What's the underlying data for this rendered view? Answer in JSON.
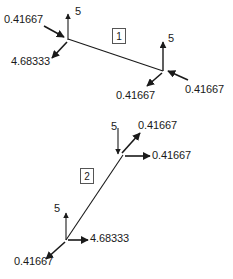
{
  "figure": {
    "type": "force-diagram",
    "background_color": "#ffffff",
    "line_color": "#1a1a1a",
    "text_color": "#1a1a1a",
    "width": 233,
    "height": 279
  },
  "elements": [
    {
      "id": "element-1",
      "number_label": "1",
      "box": {
        "x": 112,
        "y": 28
      },
      "member": {
        "x1": 68,
        "y1": 39,
        "x2": 163,
        "y2": 71
      },
      "nodes": [
        {
          "id": "element-1-node-left",
          "x": 68,
          "y": 39,
          "forces": [
            {
              "id": "e1-n1-vertical",
              "value": "5",
              "direction": "up",
              "label_x": 75,
              "label_y": 6
            },
            {
              "id": "e1-n1-axial",
              "value": "0.41667",
              "direction": "right-down-into-node",
              "label_x": 4,
              "label_y": 14
            },
            {
              "id": "e1-n1-shear",
              "value": "4.68333",
              "direction": "down-left-out-of-node",
              "label_x": 11,
              "label_y": 56
            }
          ]
        },
        {
          "id": "element-1-node-right",
          "x": 163,
          "y": 71,
          "forces": [
            {
              "id": "e1-n2-vertical",
              "value": "5",
              "direction": "up",
              "label_x": 168,
              "label_y": 33
            },
            {
              "id": "e1-n2-axial",
              "value": "0.41667",
              "direction": "left-into-node",
              "label_x": 185,
              "label_y": 84
            },
            {
              "id": "e1-n2-shear",
              "value": "0.41667",
              "direction": "down-left-out-of-node",
              "label_x": 116,
              "label_y": 90
            }
          ]
        }
      ]
    },
    {
      "id": "element-2",
      "number_label": "2",
      "box": {
        "x": 80,
        "y": 168
      },
      "member": {
        "x1": 123,
        "y1": 155,
        "x2": 66,
        "y2": 240
      },
      "nodes": [
        {
          "id": "element-2-node-top",
          "x": 123,
          "y": 155,
          "forces": [
            {
              "id": "e2-n1-vertical",
              "value": "5",
              "direction": "down-into-node",
              "label_x": 111,
              "label_y": 121
            },
            {
              "id": "e2-n1-diagonal",
              "value": "0.41667",
              "direction": "up-right-out-of-node",
              "label_x": 138,
              "label_y": 120
            },
            {
              "id": "e2-n1-horizontal",
              "value": "0.41667",
              "direction": "right-out-of-node",
              "label_x": 152,
              "label_y": 151
            }
          ]
        },
        {
          "id": "element-2-node-bottom",
          "x": 66,
          "y": 240,
          "forces": [
            {
              "id": "e2-n2-vertical",
              "value": "5",
              "direction": "up",
              "label_x": 54,
              "label_y": 203
            },
            {
              "id": "e2-n2-horizontal",
              "value": "4.68333",
              "direction": "right-out-of-node",
              "label_x": 88,
              "label_y": 232
            },
            {
              "id": "e2-n2-diagonal",
              "value": "0.41667",
              "direction": "down-left-out-of-node",
              "label_x": 14,
              "label_y": 256
            }
          ]
        }
      ]
    }
  ]
}
